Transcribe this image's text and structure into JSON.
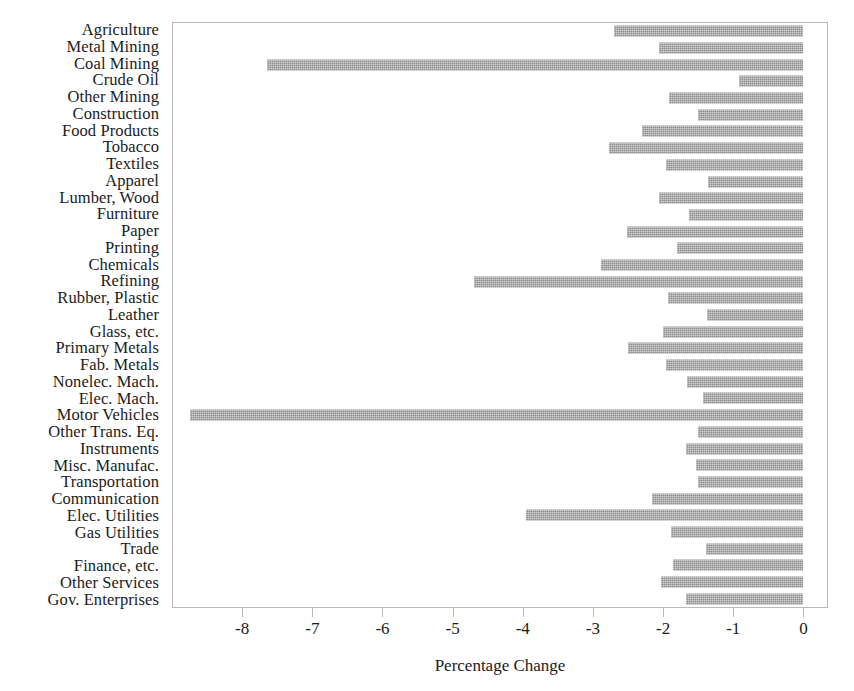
{
  "chart_data": {
    "type": "bar",
    "orientation": "horizontal",
    "title": "",
    "xlabel": "Percentage Change",
    "ylabel": "",
    "xlim": [
      -9.0,
      0.35
    ],
    "xticks": [
      -8,
      -7,
      -6,
      -5,
      -4,
      -3,
      -2,
      -1,
      0
    ],
    "xticklabels": [
      "-8",
      "-7",
      "-6",
      "-5",
      "-4",
      "-3",
      "-2",
      "-1",
      "0"
    ],
    "grid": false,
    "legend": null,
    "bar_color": "#8e8e8e",
    "categories": [
      "Agriculture",
      "Metal Mining",
      "Coal Mining",
      "Crude Oil",
      "Other Mining",
      "Construction",
      "Food Products",
      "Tobacco",
      "Textiles",
      "Apparel",
      "Lumber, Wood",
      "Furniture",
      "Paper",
      "Printing",
      "Chemicals",
      "Refining",
      "Rubber, Plastic",
      "Leather",
      "Glass, etc.",
      "Primary Metals",
      "Fab. Metals",
      "Nonelec. Mach.",
      "Elec. Mach.",
      "Motor Vehicles",
      "Other Trans. Eq.",
      "Instruments",
      "Misc. Manufac.",
      "Transportation",
      "Communication",
      "Elec. Utilities",
      "Gas Utilities",
      "Trade",
      "Finance, etc.",
      "Other Services",
      "Gov. Enterprises"
    ],
    "values": [
      -2.69,
      -2.05,
      -7.65,
      -0.91,
      -1.91,
      -1.49,
      -2.29,
      -2.77,
      -1.95,
      -1.35,
      -2.05,
      -1.62,
      -2.51,
      -1.8,
      -2.88,
      -4.69,
      -1.92,
      -1.37,
      -2.0,
      -2.5,
      -1.95,
      -1.65,
      -1.42,
      -8.75,
      -1.49,
      -1.66,
      -1.52,
      -1.49,
      -2.15,
      -3.95,
      -1.88,
      -1.38,
      -1.85,
      -2.03,
      -1.66
    ]
  }
}
